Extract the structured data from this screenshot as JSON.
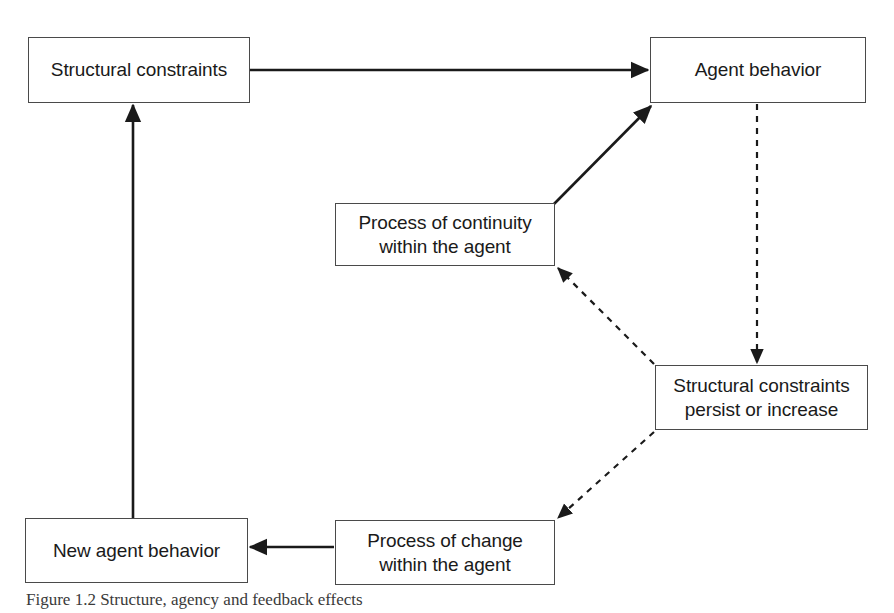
{
  "figure": {
    "caption": "Figure 1.2 Structure, agency and feedback effects",
    "background_color": "#ffffff",
    "line_color": "#1a1a1a",
    "box_border_color": "#4a4a4a"
  },
  "diagram": {
    "type": "flow-diagram",
    "nodes": [
      {
        "id": "structural-constraints",
        "label": "Structural constraints",
        "x": 28,
        "y": 37,
        "width": 222,
        "height": 66
      },
      {
        "id": "agent-behavior",
        "label": "Agent behavior",
        "x": 650,
        "y": 37,
        "width": 216,
        "height": 66
      },
      {
        "id": "process-of-continuity",
        "label": "Process of continuity\nwithin the agent",
        "x": 335,
        "y": 203,
        "width": 220,
        "height": 63
      },
      {
        "id": "structural-constraints-persist",
        "label": "Structural constraints\npersist or increase",
        "x": 655,
        "y": 365,
        "width": 213,
        "height": 65
      },
      {
        "id": "new-agent-behavior",
        "label": "New agent behavior",
        "x": 25,
        "y": 518,
        "width": 223,
        "height": 65
      },
      {
        "id": "process-of-change",
        "label": "Process of change\nwithin the agent",
        "x": 335,
        "y": 520,
        "width": 220,
        "height": 65
      }
    ],
    "edges": [
      {
        "id": "edge-constraints-to-behavior",
        "from": "structural-constraints",
        "to": "agent-behavior",
        "style": "solid",
        "direction": "right"
      },
      {
        "id": "edge-continuity-to-behavior",
        "from": "process-of-continuity",
        "to": "agent-behavior",
        "style": "solid",
        "direction": "up-right"
      },
      {
        "id": "edge-behavior-to-persist",
        "from": "agent-behavior",
        "to": "structural-constraints-persist",
        "style": "dashed",
        "direction": "down"
      },
      {
        "id": "edge-persist-to-continuity",
        "from": "structural-constraints-persist",
        "to": "process-of-continuity",
        "style": "dashed",
        "direction": "up-left"
      },
      {
        "id": "edge-persist-to-change",
        "from": "structural-constraints-persist",
        "to": "process-of-change",
        "style": "dashed",
        "direction": "down-left"
      },
      {
        "id": "edge-change-to-new-behavior",
        "from": "process-of-change",
        "to": "new-agent-behavior",
        "style": "solid",
        "direction": "left"
      },
      {
        "id": "edge-new-behavior-to-constraints",
        "from": "new-agent-behavior",
        "to": "structural-constraints",
        "style": "solid",
        "direction": "up"
      }
    ]
  }
}
